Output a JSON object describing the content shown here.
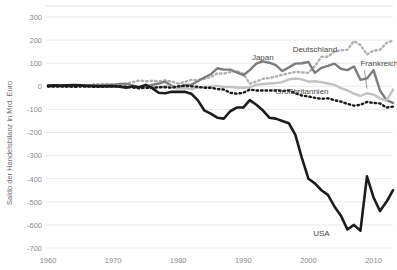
{
  "chart_data": {
    "type": "line",
    "title": "",
    "xlabel": "",
    "ylabel": "Saldo der Handelsbilanz in Mrd. Euro",
    "xlim": [
      1960,
      2013
    ],
    "ylim": [
      -700,
      300
    ],
    "ytick_step": 100,
    "yticks": [
      300,
      200,
      100,
      0,
      -100,
      -200,
      -300,
      -400,
      -500,
      -600,
      -700
    ],
    "ytick_labels": [
      "300",
      "200",
      "100",
      "0",
      "-100",
      "-200",
      "-300",
      "-400",
      "-500",
      "-600",
      "-700"
    ],
    "xticks": [
      1960,
      1970,
      1980,
      1990,
      2000,
      2010
    ],
    "xtick_labels": [
      "1960",
      "1970",
      "1980",
      "1990",
      "2000",
      "2010"
    ],
    "grid": true,
    "legend_position": "inline-annotations",
    "series": [
      {
        "name": "Deutschland",
        "color": "#b0b0b0",
        "style": "dotted",
        "width": 2.4,
        "label_x": 2001,
        "label_y": 148,
        "leader": false,
        "x": [
          1960,
          1961,
          1962,
          1963,
          1964,
          1965,
          1966,
          1967,
          1968,
          1969,
          1970,
          1971,
          1972,
          1973,
          1974,
          1975,
          1976,
          1977,
          1978,
          1979,
          1980,
          1981,
          1982,
          1983,
          1984,
          1985,
          1986,
          1987,
          1988,
          1989,
          1990,
          1991,
          1992,
          1993,
          1994,
          1995,
          1996,
          1997,
          1998,
          1999,
          2000,
          2001,
          2002,
          2003,
          2004,
          2005,
          2006,
          2007,
          2008,
          2009,
          2010,
          2011,
          2012,
          2013
        ],
        "values": [
          2,
          3,
          2,
          4,
          3,
          2,
          5,
          8,
          10,
          9,
          8,
          9,
          12,
          18,
          25,
          22,
          24,
          22,
          26,
          20,
          12,
          18,
          28,
          26,
          32,
          40,
          56,
          55,
          62,
          66,
          54,
          12,
          20,
          32,
          36,
          42,
          50,
          56,
          62,
          60,
          58,
          88,
          128,
          128,
          150,
          156,
          158,
          196,
          178,
          138,
          154,
          158,
          188,
          198
        ]
      },
      {
        "name": "Japan",
        "color": "#7d7d7d",
        "style": "solid",
        "width": 2.4,
        "label_x": 1993,
        "label_y": 112,
        "leader": false,
        "x": [
          1960,
          1961,
          1962,
          1963,
          1964,
          1965,
          1966,
          1967,
          1968,
          1969,
          1970,
          1971,
          1972,
          1973,
          1974,
          1975,
          1976,
          1977,
          1978,
          1979,
          1980,
          1981,
          1982,
          1983,
          1984,
          1985,
          1986,
          1987,
          1988,
          1989,
          1990,
          1991,
          1992,
          1993,
          1994,
          1995,
          1996,
          1997,
          1998,
          1999,
          2000,
          2001,
          2002,
          2003,
          2004,
          2005,
          2006,
          2007,
          2008,
          2009,
          2010,
          2011,
          2012,
          2013
        ],
        "values": [
          0,
          1,
          1,
          0,
          1,
          2,
          3,
          2,
          4,
          6,
          6,
          10,
          10,
          4,
          -4,
          0,
          6,
          12,
          20,
          2,
          -8,
          6,
          6,
          22,
          38,
          52,
          78,
          72,
          72,
          60,
          48,
          70,
          98,
          108,
          102,
          92,
          66,
          82,
          98,
          100,
          105,
          58,
          80,
          88,
          98,
          76,
          70,
          86,
          28,
          34,
          70,
          -18,
          -60,
          -72
        ]
      },
      {
        "name": "Frankreich",
        "color": "#c2c2c2",
        "style": "solid",
        "width": 2.4,
        "label_x": 2008,
        "label_y": 88,
        "leader": true,
        "leader_to_x": 2009,
        "leader_to_y": -10,
        "x": [
          1960,
          1961,
          1962,
          1963,
          1964,
          1965,
          1966,
          1967,
          1968,
          1969,
          1970,
          1971,
          1972,
          1973,
          1974,
          1975,
          1976,
          1977,
          1978,
          1979,
          1980,
          1981,
          1982,
          1983,
          1984,
          1985,
          1986,
          1987,
          1988,
          1989,
          1990,
          1991,
          1992,
          1993,
          1994,
          1995,
          1996,
          1997,
          1998,
          1999,
          2000,
          2001,
          2002,
          2003,
          2004,
          2005,
          2006,
          2007,
          2008,
          2009,
          2010,
          2011,
          2012,
          2013
        ],
        "values": [
          1,
          2,
          1,
          0,
          -1,
          2,
          1,
          1,
          0,
          -2,
          0,
          1,
          2,
          0,
          -5,
          0,
          -6,
          -4,
          0,
          -3,
          -10,
          -8,
          -12,
          -6,
          -3,
          -2,
          2,
          -3,
          -3,
          -5,
          -6,
          -4,
          6,
          10,
          12,
          14,
          18,
          30,
          34,
          30,
          20,
          22,
          18,
          12,
          6,
          -8,
          -18,
          -32,
          -42,
          -30,
          -36,
          -52,
          -62,
          -14
        ]
      },
      {
        "name": "Großbritannien",
        "color": "#1c1c1c",
        "style": "dotted",
        "width": 2.4,
        "label_x": 1999,
        "label_y": -32,
        "leader": false,
        "x": [
          1960,
          1961,
          1962,
          1963,
          1964,
          1965,
          1966,
          1967,
          1968,
          1969,
          1970,
          1971,
          1972,
          1973,
          1974,
          1975,
          1976,
          1977,
          1978,
          1979,
          1980,
          1981,
          1982,
          1983,
          1984,
          1985,
          1986,
          1987,
          1988,
          1989,
          1990,
          1991,
          1992,
          1993,
          1994,
          1995,
          1996,
          1997,
          1998,
          1999,
          2000,
          2001,
          2002,
          2003,
          2004,
          2005,
          2006,
          2007,
          2008,
          2009,
          2010,
          2011,
          2012,
          2013
        ],
        "values": [
          -1,
          -1,
          -1,
          -1,
          -2,
          -1,
          -1,
          -2,
          -2,
          -1,
          -1,
          0,
          -2,
          -5,
          -9,
          -6,
          -6,
          -4,
          -4,
          -6,
          0,
          2,
          0,
          -2,
          -6,
          -6,
          -12,
          -14,
          -28,
          -32,
          -28,
          -14,
          -18,
          -18,
          -18,
          -18,
          -20,
          -18,
          -30,
          -40,
          -44,
          -50,
          -54,
          -52,
          -60,
          -66,
          -76,
          -84,
          -80,
          -68,
          -72,
          -74,
          -92,
          -88
        ]
      },
      {
        "name": "USA",
        "color": "#1c1c1c",
        "style": "solid",
        "width": 2.6,
        "label_x": 2002,
        "label_y": -650,
        "leader": false,
        "x": [
          1960,
          1961,
          1962,
          1963,
          1964,
          1965,
          1966,
          1967,
          1968,
          1969,
          1970,
          1971,
          1972,
          1973,
          1974,
          1975,
          1976,
          1977,
          1978,
          1979,
          1980,
          1981,
          1982,
          1983,
          1984,
          1985,
          1986,
          1987,
          1988,
          1989,
          1990,
          1991,
          1992,
          1993,
          1994,
          1995,
          1996,
          1997,
          1998,
          1999,
          2000,
          2001,
          2002,
          2003,
          2004,
          2005,
          2006,
          2007,
          2008,
          2009,
          2010,
          2011,
          2012,
          2013
        ],
        "values": [
          3,
          4,
          3,
          4,
          5,
          4,
          2,
          2,
          0,
          0,
          1,
          -2,
          -6,
          0,
          -4,
          6,
          -8,
          -28,
          -30,
          -24,
          -24,
          -24,
          -32,
          -60,
          -104,
          -118,
          -136,
          -140,
          -108,
          -92,
          -92,
          -60,
          -80,
          -104,
          -136,
          -140,
          -150,
          -160,
          -210,
          -310,
          -400,
          -420,
          -450,
          -470,
          -520,
          -560,
          -620,
          -600,
          -625,
          -390,
          -480,
          -540,
          -500,
          -450
        ]
      }
    ]
  }
}
